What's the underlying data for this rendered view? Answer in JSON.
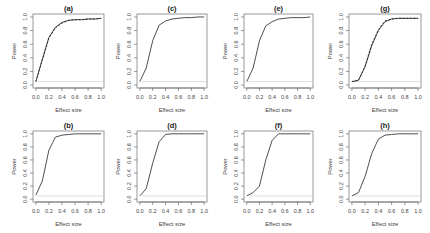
{
  "figure": {
    "background": "#ffffff",
    "line_color": "#222222",
    "reference_color": "#c8c8c8",
    "axis_color": "#555555"
  },
  "chart_data": [
    {
      "id": "a",
      "title": "(a)",
      "type": "line",
      "xlabel": "Effect size",
      "ylabel": "Power",
      "xlim": [
        0,
        1
      ],
      "ylim": [
        0,
        1
      ],
      "xticks": [
        "0.0",
        "0.2",
        "0.4",
        "0.6",
        "0.8",
        "1.0"
      ],
      "yticks": [
        "0.0",
        "0.2",
        "0.4",
        "0.6",
        "0.8",
        "1.0"
      ],
      "reference_line": 0.05,
      "series": [
        {
          "name": "solid",
          "style": "solid",
          "x": [
            0,
            0.1,
            0.2,
            0.3,
            0.4,
            0.5,
            0.6,
            0.7,
            0.8,
            0.9,
            1.0
          ],
          "y": [
            0.05,
            0.38,
            0.7,
            0.85,
            0.92,
            0.95,
            0.96,
            0.96,
            0.97,
            0.97,
            0.98
          ]
        },
        {
          "name": "dashed",
          "style": "dashed",
          "x": [
            0,
            0.1,
            0.2,
            0.3,
            0.4,
            0.5,
            0.6,
            0.7,
            0.8,
            0.9,
            1.0
          ],
          "y": [
            0.05,
            0.37,
            0.69,
            0.84,
            0.91,
            0.95,
            0.96,
            0.96,
            0.97,
            0.97,
            0.98
          ]
        }
      ]
    },
    {
      "id": "b",
      "title": "(b)",
      "type": "line",
      "xlabel": "Effect size",
      "ylabel": "Power",
      "xlim": [
        0,
        1
      ],
      "ylim": [
        0,
        1
      ],
      "xticks": [
        "0.0",
        "0.2",
        "0.4",
        "0.6",
        "0.8",
        "1.0"
      ],
      "yticks": [
        "0.0",
        "0.2",
        "0.4",
        "0.6",
        "0.8",
        "1.0"
      ],
      "reference_line": 0.05,
      "series": [
        {
          "name": "solid",
          "style": "solid",
          "x": [
            0,
            0.1,
            0.2,
            0.3,
            0.4,
            0.5,
            0.6,
            0.7,
            0.8,
            0.9,
            1.0
          ],
          "y": [
            0.06,
            0.28,
            0.75,
            0.95,
            0.98,
            0.99,
            1.0,
            1.0,
            1.0,
            1.0,
            1.0
          ]
        }
      ]
    },
    {
      "id": "c",
      "title": "(c)",
      "type": "line",
      "xlabel": "Effect size",
      "ylabel": "Power",
      "xlim": [
        0,
        1
      ],
      "ylim": [
        0,
        1
      ],
      "xticks": [
        "0.0",
        "0.2",
        "0.4",
        "0.6",
        "0.8",
        "1.0"
      ],
      "yticks": [
        "0.0",
        "0.2",
        "0.4",
        "0.6",
        "0.8",
        "1.0"
      ],
      "reference_line": 0.05,
      "series": [
        {
          "name": "solid",
          "style": "solid",
          "x": [
            0,
            0.1,
            0.2,
            0.3,
            0.4,
            0.5,
            0.6,
            0.7,
            0.8,
            0.9,
            1.0
          ],
          "y": [
            0.05,
            0.25,
            0.65,
            0.88,
            0.94,
            0.97,
            0.98,
            0.99,
            0.99,
            1.0,
            1.0
          ]
        }
      ]
    },
    {
      "id": "d",
      "title": "(d)",
      "type": "line",
      "xlabel": "Effect size",
      "ylabel": "Power",
      "xlim": [
        0,
        1
      ],
      "ylim": [
        0,
        1
      ],
      "xticks": [
        "0.0",
        "0.2",
        "0.4",
        "0.6",
        "0.8",
        "1.0"
      ],
      "yticks": [
        "0.0",
        "0.2",
        "0.4",
        "0.6",
        "0.8",
        "1.0"
      ],
      "reference_line": 0.05,
      "series": [
        {
          "name": "solid",
          "style": "solid",
          "x": [
            0,
            0.1,
            0.2,
            0.3,
            0.4,
            0.5,
            0.6,
            0.7,
            0.8,
            0.9,
            1.0
          ],
          "y": [
            0.05,
            0.16,
            0.55,
            0.88,
            0.99,
            1.0,
            1.0,
            1.0,
            1.0,
            1.0,
            1.0
          ]
        }
      ]
    },
    {
      "id": "e",
      "title": "(e)",
      "type": "line",
      "xlabel": "Effect size",
      "ylabel": "Power",
      "xlim": [
        0,
        1
      ],
      "ylim": [
        0,
        1
      ],
      "xticks": [
        "0.0",
        "0.2",
        "0.4",
        "0.6",
        "0.8",
        "1.0"
      ],
      "yticks": [
        "0.0",
        "0.2",
        "0.4",
        "0.6",
        "0.8",
        "1.0"
      ],
      "reference_line": 0.05,
      "series": [
        {
          "name": "solid",
          "style": "solid",
          "x": [
            0,
            0.1,
            0.2,
            0.3,
            0.4,
            0.5,
            0.6,
            0.7,
            0.8,
            0.9,
            1.0
          ],
          "y": [
            0.05,
            0.25,
            0.65,
            0.87,
            0.93,
            0.97,
            0.98,
            0.99,
            0.99,
            0.99,
            1.0
          ]
        }
      ]
    },
    {
      "id": "f",
      "title": "(f)",
      "type": "line",
      "xlabel": "Effect size",
      "ylabel": "Power",
      "xlim": [
        0,
        1
      ],
      "ylim": [
        0,
        1
      ],
      "xticks": [
        "0.0",
        "0.2",
        "0.4",
        "0.6",
        "0.8",
        "1.0"
      ],
      "yticks": [
        "0.0",
        "0.2",
        "0.4",
        "0.6",
        "0.8",
        "1.0"
      ],
      "reference_line": 0.05,
      "series": [
        {
          "name": "solid",
          "style": "solid",
          "x": [
            0,
            0.1,
            0.2,
            0.3,
            0.4,
            0.5,
            0.6,
            0.7,
            0.8,
            0.9,
            1.0
          ],
          "y": [
            0.05,
            0.1,
            0.2,
            0.6,
            0.9,
            1.0,
            1.0,
            1.0,
            1.0,
            1.0,
            1.0
          ]
        }
      ]
    },
    {
      "id": "g",
      "title": "(g)",
      "type": "line",
      "xlabel": "Effect size",
      "ylabel": "Power",
      "xlim": [
        0,
        1
      ],
      "ylim": [
        0,
        1
      ],
      "xticks": [
        "0.0",
        "0.2",
        "0.4",
        "0.6",
        "0.8",
        "1.0"
      ],
      "yticks": [
        "0.0",
        "0.2",
        "0.4",
        "0.6",
        "0.8",
        "1.0"
      ],
      "reference_line": 0.05,
      "series": [
        {
          "name": "solid",
          "style": "solid",
          "x": [
            0,
            0.1,
            0.2,
            0.3,
            0.4,
            0.5,
            0.6,
            0.7,
            0.8,
            0.9,
            1.0
          ],
          "y": [
            0.05,
            0.07,
            0.27,
            0.58,
            0.8,
            0.93,
            0.97,
            0.98,
            0.98,
            0.98,
            0.98
          ]
        },
        {
          "name": "dashed",
          "style": "dashed",
          "x": [
            0,
            0.1,
            0.2,
            0.3,
            0.4,
            0.5,
            0.6,
            0.7,
            0.8,
            0.9,
            1.0
          ],
          "y": [
            0.05,
            0.07,
            0.28,
            0.6,
            0.81,
            0.94,
            0.97,
            0.98,
            0.98,
            0.98,
            0.98
          ]
        }
      ]
    },
    {
      "id": "h",
      "title": "(h)",
      "type": "line",
      "xlabel": "Effect size",
      "ylabel": "Power",
      "xlim": [
        0,
        1
      ],
      "ylim": [
        0,
        1
      ],
      "xticks": [
        "0.0",
        "0.2",
        "0.4",
        "0.6",
        "0.8",
        "1.0"
      ],
      "yticks": [
        "0.0",
        "0.2",
        "0.4",
        "0.6",
        "0.8",
        "1.0"
      ],
      "reference_line": 0.05,
      "series": [
        {
          "name": "solid",
          "style": "solid",
          "x": [
            0,
            0.1,
            0.2,
            0.3,
            0.4,
            0.5,
            0.6,
            0.7,
            0.8,
            0.9,
            1.0
          ],
          "y": [
            0.05,
            0.1,
            0.35,
            0.7,
            0.92,
            0.98,
            0.99,
            1.0,
            1.0,
            1.0,
            1.0
          ]
        }
      ]
    }
  ],
  "layout": {
    "panel_boxes": {
      "a": {
        "x": 33,
        "y": 14,
        "w": 71,
        "h": 74
      },
      "c": {
        "x": 137,
        "y": 14,
        "w": 70,
        "h": 74
      },
      "e": {
        "x": 244,
        "y": 14,
        "w": 69,
        "h": 74
      },
      "g": {
        "x": 349,
        "y": 14,
        "w": 72,
        "h": 74
      },
      "b": {
        "x": 33,
        "y": 131,
        "w": 71,
        "h": 71
      },
      "d": {
        "x": 137,
        "y": 131,
        "w": 70,
        "h": 71
      },
      "f": {
        "x": 244,
        "y": 131,
        "w": 69,
        "h": 71
      },
      "h": {
        "x": 349,
        "y": 131,
        "w": 72,
        "h": 71
      }
    }
  }
}
